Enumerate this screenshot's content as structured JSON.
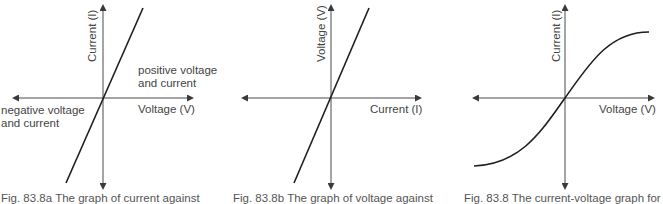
{
  "figures": [
    {
      "id": "83.8a",
      "y_axis_label": "Current (I)",
      "x_axis_label": "Voltage (V)",
      "annotation_positive": [
        "positive voltage",
        "and current"
      ],
      "annotation_negative": [
        "negative voltage",
        "and current"
      ],
      "curve": "straight line through origin, steep positive slope",
      "caption": "Fig. 83.8a  The graph of current against"
    },
    {
      "id": "83.8b",
      "y_axis_label": "Voltage (V)",
      "x_axis_label": "Current (I)",
      "curve": "straight line through origin, steep positive slope",
      "caption": "Fig. 83.8b  The graph of voltage against"
    },
    {
      "id": "83.8c",
      "y_axis_label": "Current (I)",
      "x_axis_label": "Voltage (V)",
      "curve": "S-shaped curve through origin, levelling off at both ends",
      "caption": "Fig. 83.8 The current-voltage graph for"
    }
  ],
  "colors": {
    "line": "#1e1e1e",
    "axis": "#4a4a4a",
    "text": "#444444"
  }
}
